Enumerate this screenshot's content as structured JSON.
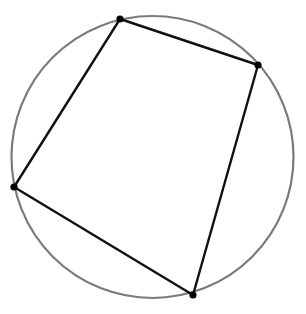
{
  "diagram": {
    "type": "cyclic-quadrilateral",
    "canvas": {
      "width": 306,
      "height": 314,
      "background": "#ffffff"
    },
    "circle": {
      "cx": 152.5,
      "cy": 157,
      "r": 141,
      "stroke": "#7a7a7a",
      "stroke_width": 2.2
    },
    "quadrilateral": {
      "stroke": "#111111",
      "stroke_width": 2.4,
      "vertices": [
        {
          "id": "top",
          "x": 120,
          "y": 19
        },
        {
          "id": "right",
          "x": 258,
          "y": 65
        },
        {
          "id": "bottom",
          "x": 193,
          "y": 295
        },
        {
          "id": "left",
          "x": 14,
          "y": 187
        }
      ]
    },
    "vertex_dot": {
      "r": 3.6,
      "fill": "#000000"
    }
  }
}
